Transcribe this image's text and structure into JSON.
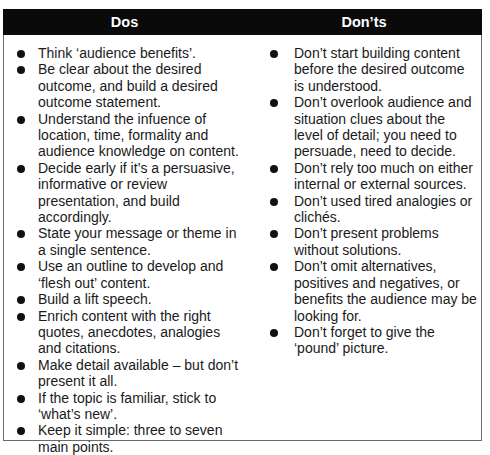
{
  "table": {
    "headers": {
      "dos": "Dos",
      "donts": "Don’ts"
    },
    "dos": [
      "Think ‘audience benefits’.",
      "Be clear about the desired outcome, and build a desired outcome statement.",
      "Understand the infuence of location, time, formality and audience knowledge on content.",
      "Decide early if it’s a persuasive, informative or review presentation, and build accordingly.",
      "State your message or theme in a single sentence.",
      "Use an outline to develop and ‘flesh out’ content.",
      "Build a lift speech.",
      "Enrich content with the right quotes, anecdotes, analogies and citations.",
      "Make detail available – but don’t present it all.",
      "If the topic is familiar, stick to ‘what’s new’.",
      "Keep it simple: three to seven main points."
    ],
    "donts": [
      "Don’t start building content before the desired outcome is understood.",
      "Don’t overlook audience and situation clues about the level of detail; you need to persuade, need to decide.",
      "Don’t rely too much on either internal or external sources.",
      "Don’t used tired analogies or clichés.",
      "Don’t present problems without solutions.",
      "Don’t omit alternatives, positives and negatives, or benefits the audience may be looking for.",
      "Don’t forget to give the ‘pound’ picture."
    ]
  },
  "colors": {
    "header_bg": "#0a0a0a",
    "header_text": "#ffffff",
    "border": "#6a6a6a",
    "text": "#1a1a1a"
  }
}
